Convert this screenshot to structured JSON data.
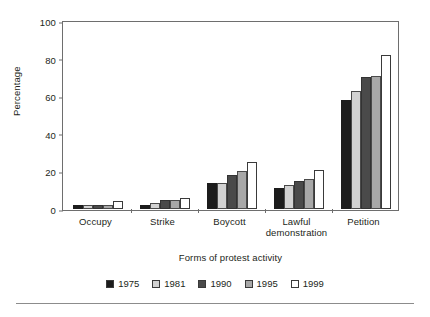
{
  "chart_data": {
    "type": "bar",
    "title": "",
    "subtitle": "",
    "xlabel": "Forms of protest activity",
    "ylabel": "Percentage",
    "categories": [
      "Occupy",
      "Strike",
      "Boycott",
      "Lawful demonstration",
      "Petition"
    ],
    "category_lines": [
      [
        "Occupy"
      ],
      [
        "Strike"
      ],
      [
        "Boycott"
      ],
      [
        "Lawful",
        "demonstration"
      ],
      [
        "Petition"
      ]
    ],
    "series": [
      {
        "name": "1975",
        "color": "#1c1c1c",
        "values": [
          2,
          2,
          14,
          11,
          58
        ]
      },
      {
        "name": "1981",
        "color": "#d2d2d2",
        "values": [
          2,
          3,
          14,
          13,
          63
        ]
      },
      {
        "name": "1990",
        "color": "#4a4a4a",
        "values": [
          2,
          5,
          18,
          15,
          70
        ]
      },
      {
        "name": "1995",
        "color": "#a8a8a8",
        "values": [
          2,
          5,
          20,
          16,
          71
        ]
      },
      {
        "name": "1999",
        "color": "#ffffff",
        "values": [
          4,
          6,
          25,
          21,
          82
        ]
      }
    ],
    "ylim": [
      0,
      100
    ],
    "yticks": [
      0,
      20,
      40,
      60,
      80,
      100
    ],
    "ytick_labels": [
      "0",
      "20",
      "40",
      "60",
      "80",
      "100"
    ],
    "grid": false,
    "legend_position": "bottom"
  }
}
